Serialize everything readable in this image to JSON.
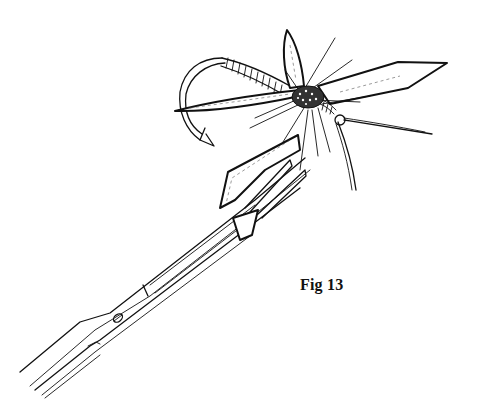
{
  "figure": {
    "caption": "Fig 13",
    "colors": {
      "ink": "#111111",
      "background": "#ffffff"
    }
  }
}
